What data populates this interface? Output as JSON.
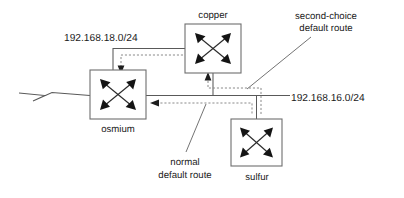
{
  "diagram": {
    "type": "network-topology",
    "canvas": {
      "width": 404,
      "height": 198
    },
    "colors": {
      "background": "#ffffff",
      "box_stroke": "#6e6e6e",
      "link_solid": "#595959",
      "route_dashed": "#8a8a8a",
      "text": "#1a1a1a",
      "arrow_fill": "#141414"
    },
    "nodes": [
      {
        "id": "copper",
        "label": "copper",
        "icon": "router-icon",
        "label_position": "above",
        "box": {
          "x": 185,
          "y": 24,
          "w": 56,
          "h": 49
        },
        "label_xy": {
          "x": 213,
          "y": 18
        }
      },
      {
        "id": "osmium",
        "label": "osmium",
        "icon": "router-icon",
        "label_position": "below",
        "box": {
          "x": 90,
          "y": 70,
          "w": 56,
          "h": 49
        },
        "label_xy": {
          "x": 118,
          "y": 132
        }
      },
      {
        "id": "sulfur",
        "label": "sulfur",
        "icon": "router-icon",
        "label_position": "below",
        "box": {
          "x": 231,
          "y": 119,
          "w": 51,
          "h": 47
        },
        "label_xy": {
          "x": 257,
          "y": 180
        }
      }
    ],
    "networks": [
      {
        "id": "net-18",
        "label": "192.168.18.0/24",
        "label_xy": {
          "x": 64,
          "y": 41
        },
        "anchor": "start",
        "connects": [
          "osmium",
          "copper"
        ]
      },
      {
        "id": "net-16",
        "label": "192.168.16.0/24",
        "label_xy": {
          "x": 291,
          "y": 101
        },
        "anchor": "start",
        "connects": [
          "osmium",
          "copper",
          "sulfur"
        ]
      }
    ],
    "annotations": [
      {
        "id": "annot-second-choice",
        "lines": [
          "second-choice",
          "default route"
        ],
        "line_xy": [
          {
            "x": 326,
            "y": 19
          },
          {
            "x": 326,
            "y": 31
          }
        ],
        "anchor": "middle",
        "leader": {
          "x1": 311,
          "y1": 37,
          "x2": 247,
          "y2": 89
        }
      },
      {
        "id": "annot-normal",
        "lines": [
          "normal",
          "default route"
        ],
        "line_xy": [
          {
            "x": 185,
            "y": 165
          },
          {
            "x": 185,
            "y": 178
          }
        ],
        "anchor": "middle",
        "leader": {
          "x1": 186,
          "y1": 152,
          "x2": 206,
          "y2": 104
        }
      }
    ],
    "routes": [
      {
        "id": "normal-default-route",
        "style": "dashed",
        "description": "sulfur to osmium via 192.168.16.0/24",
        "direction": "right-to-left"
      },
      {
        "id": "second-choice-default-route",
        "style": "dashed",
        "description": "sulfur up to copper via 192.168.16.0/24",
        "direction": "up"
      },
      {
        "id": "copper-to-osmium-route",
        "style": "dashed",
        "description": "copper to osmium via 192.168.18.0/24",
        "direction": "down"
      }
    ],
    "wan_link": {
      "id": "wan-zigzag",
      "description": "external serial link into osmium",
      "style": "zigzag"
    }
  }
}
